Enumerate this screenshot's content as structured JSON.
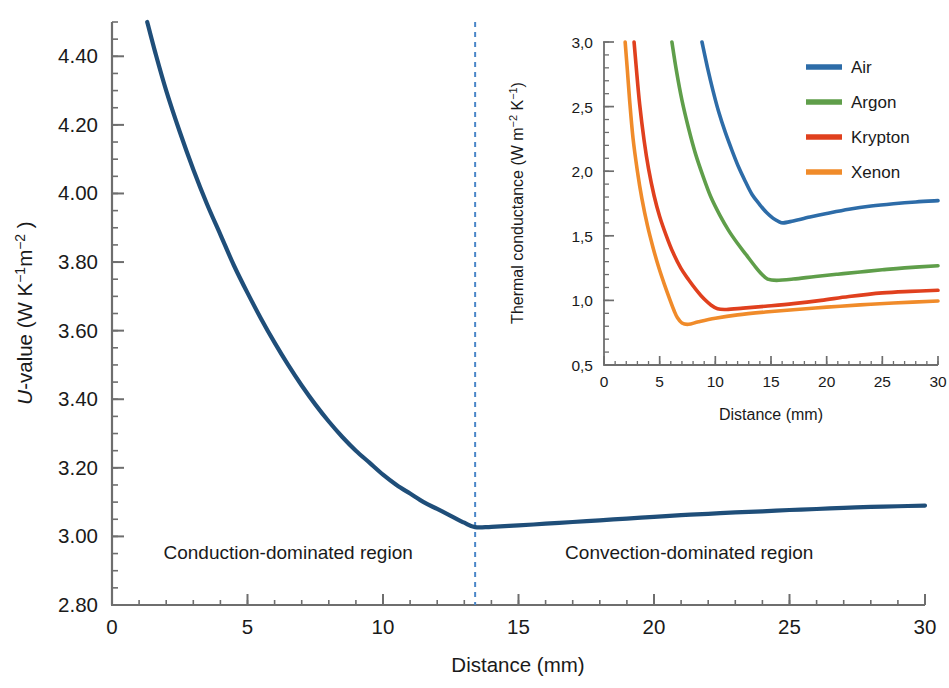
{
  "chart_data": [
    {
      "id": "main",
      "type": "line",
      "title": "",
      "xlabel": "Distance (mm)",
      "ylabel": "U-value (W K−1 m−2)",
      "ylabel_parts": {
        "italic_prefix": "U",
        "rest": "-value (W K",
        "sup1": "−1",
        "mid": "m",
        "sup2": "−2",
        "tail": " )"
      },
      "xlim": [
        0,
        30
      ],
      "ylim": [
        2.8,
        4.5
      ],
      "xticks": [
        0,
        5,
        10,
        15,
        20,
        25,
        30
      ],
      "xtick_labels": [
        "0",
        "5",
        "10",
        "15",
        "20",
        "25",
        "30"
      ],
      "yticks": [
        2.8,
        3.0,
        3.2,
        3.4,
        3.6,
        3.8,
        4.0,
        4.2,
        4.4
      ],
      "ytick_labels": [
        "2.80",
        "3.00",
        "3.20",
        "3.40",
        "3.60",
        "3.80",
        "4.00",
        "4.20",
        "4.40"
      ],
      "minor_x_step": 1,
      "minor_y_step": 0.05,
      "grid": false,
      "legend_position": "none",
      "line_color": "#1f4e79",
      "line_width": 4.2,
      "series": [
        {
          "name": "U-value",
          "color": "#1f4e79",
          "x": [
            1.3,
            1.6,
            2.0,
            2.5,
            3.0,
            3.5,
            4.0,
            4.5,
            5.0,
            5.5,
            6.0,
            6.5,
            7.0,
            7.5,
            8.0,
            8.5,
            9.0,
            9.5,
            10.0,
            10.5,
            11.0,
            11.5,
            12.0,
            12.5,
            13.0,
            13.4,
            14.0,
            15.0,
            16.0,
            17.0,
            18.0,
            19.0,
            20.0,
            21.0,
            22.0,
            23.0,
            24.0,
            25.0,
            26.0,
            27.0,
            28.0,
            29.0,
            30.0
          ],
          "y": [
            4.5,
            4.41,
            4.3,
            4.18,
            4.07,
            3.97,
            3.88,
            3.79,
            3.71,
            3.635,
            3.565,
            3.5,
            3.44,
            3.385,
            3.335,
            3.29,
            3.25,
            3.215,
            3.18,
            3.15,
            3.125,
            3.1,
            3.08,
            3.06,
            3.04,
            3.027,
            3.028,
            3.032,
            3.037,
            3.042,
            3.047,
            3.052,
            3.057,
            3.062,
            3.066,
            3.07,
            3.073,
            3.077,
            3.08,
            3.083,
            3.086,
            3.088,
            3.09
          ]
        }
      ],
      "annotations": [
        {
          "name": "conduction-region-label",
          "text": "Conduction-dominated region",
          "x": 6.5,
          "y": 2.935
        },
        {
          "name": "convection-region-label",
          "text": "Convection-dominated region",
          "x": 21.3,
          "y": 2.935
        },
        {
          "name": "transition-dashed-line",
          "type": "vline",
          "x": 13.4,
          "color": "#4a86c8",
          "style": "dashed"
        }
      ]
    },
    {
      "id": "inset",
      "type": "line",
      "title": "",
      "xlabel": "Distance (mm)",
      "ylabel": "Thermal conductance (W m−2 K−1)",
      "ylabel_parts": {
        "head": "Thermal conductance (W m",
        "sup1": "−2",
        "mid": " K",
        "sup2": "−1",
        "tail": ")"
      },
      "xlim": [
        0,
        30
      ],
      "ylim": [
        0.5,
        3.0
      ],
      "xticks": [
        0,
        5,
        10,
        15,
        20,
        25,
        30
      ],
      "xtick_labels": [
        "0",
        "5",
        "10",
        "15",
        "20",
        "25",
        "30"
      ],
      "yticks": [
        0.5,
        1.0,
        1.5,
        2.0,
        2.5,
        3.0
      ],
      "ytick_labels": [
        "0,5",
        "1,0",
        "1,5",
        "2,0",
        "2,5",
        "3,0"
      ],
      "minor_x_step": 1,
      "minor_y_step": 0.1,
      "grid": false,
      "legend_position": "upper right",
      "line_width": 3.6,
      "series": [
        {
          "name": "Air",
          "color": "#2d6ca8",
          "x": [
            8.8,
            9.3,
            9.8,
            10.3,
            10.9,
            11.5,
            12.1,
            12.7,
            13.3,
            14.0,
            14.6,
            15.2,
            15.7,
            16.1,
            17.0,
            18.5,
            20.0,
            22.0,
            24.0,
            26.0,
            28.0,
            30.0
          ],
          "y": [
            3.0,
            2.8,
            2.62,
            2.46,
            2.3,
            2.16,
            2.03,
            1.92,
            1.82,
            1.74,
            1.68,
            1.635,
            1.61,
            1.6,
            1.615,
            1.645,
            1.672,
            1.705,
            1.73,
            1.748,
            1.762,
            1.772
          ]
        },
        {
          "name": "Argon",
          "color": "#5f9e4a",
          "x": [
            6.1,
            6.5,
            7.0,
            7.6,
            8.2,
            8.9,
            9.6,
            10.4,
            11.2,
            12.0,
            12.8,
            13.6,
            14.2,
            14.7,
            15.5,
            17.0,
            19.0,
            21.0,
            23.0,
            25.0,
            27.0,
            30.0
          ],
          "y": [
            3.0,
            2.78,
            2.55,
            2.33,
            2.14,
            1.96,
            1.8,
            1.66,
            1.54,
            1.44,
            1.35,
            1.26,
            1.2,
            1.165,
            1.155,
            1.165,
            1.185,
            1.203,
            1.22,
            1.237,
            1.252,
            1.268
          ]
        },
        {
          "name": "Krypton",
          "color": "#e0401e",
          "x": [
            2.7,
            2.9,
            3.2,
            3.6,
            4.0,
            4.5,
            5.0,
            5.6,
            6.2,
            6.9,
            7.6,
            8.3,
            9.0,
            9.6,
            10.2,
            11.0,
            12.5,
            14.5,
            17.0,
            19.5,
            22.0,
            25.0,
            27.5,
            30.0
          ],
          "y": [
            3.0,
            2.8,
            2.52,
            2.24,
            2.02,
            1.81,
            1.65,
            1.5,
            1.37,
            1.25,
            1.16,
            1.08,
            1.01,
            0.965,
            0.935,
            0.93,
            0.94,
            0.955,
            0.975,
            1.0,
            1.03,
            1.058,
            1.07,
            1.078
          ]
        },
        {
          "name": "Xenon",
          "color": "#f08b2a",
          "x": [
            1.9,
            2.1,
            2.3,
            2.6,
            3.0,
            3.4,
            3.9,
            4.4,
            4.9,
            5.4,
            5.9,
            6.3,
            6.6,
            7.0,
            7.6,
            8.5,
            10.0,
            12.0,
            14.5,
            17.0,
            20.0,
            23.0,
            26.0,
            30.0
          ],
          "y": [
            3.0,
            2.78,
            2.55,
            2.26,
            2.0,
            1.79,
            1.58,
            1.41,
            1.26,
            1.13,
            1.01,
            0.92,
            0.865,
            0.825,
            0.815,
            0.835,
            0.862,
            0.888,
            0.91,
            0.928,
            0.948,
            0.965,
            0.98,
            0.995
          ]
        }
      ],
      "legend": [
        {
          "label": "Air",
          "color": "#2d6ca8"
        },
        {
          "label": "Argon",
          "color": "#5f9e4a"
        },
        {
          "label": "Krypton",
          "color": "#e0401e"
        },
        {
          "label": "Xenon",
          "color": "#f08b2a"
        }
      ]
    }
  ],
  "colors": {
    "axis": "#6e6e6e",
    "text": "#1a1a1a",
    "main_line": "#1f4e79",
    "dashed_marker": "#4a86c8",
    "background": "#ffffff",
    "air": "#2d6ca8",
    "argon": "#5f9e4a",
    "krypton": "#e0401e",
    "xenon": "#f08b2a"
  }
}
